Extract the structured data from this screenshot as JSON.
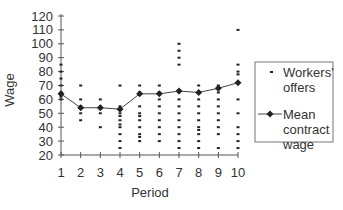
{
  "chart_data": {
    "type": "scatter",
    "title": "",
    "xlabel": "Period",
    "ylabel": "Wage",
    "xlim": [
      1,
      10
    ],
    "ylim": [
      20,
      120
    ],
    "x_ticks": [
      1,
      2,
      3,
      4,
      5,
      6,
      7,
      8,
      9,
      10
    ],
    "y_ticks": [
      20,
      30,
      40,
      50,
      60,
      70,
      80,
      90,
      100,
      110,
      120
    ],
    "grid": false,
    "legend_position": "right",
    "series": [
      {
        "name": "Workers' offers",
        "kind": "scatter",
        "marker": "dash",
        "points": [
          {
            "x": 1,
            "values": [
              85,
              80,
              75,
              70,
              65,
              62,
              60
            ]
          },
          {
            "x": 2,
            "values": [
              70,
              60,
              55,
              50,
              45
            ]
          },
          {
            "x": 3,
            "values": [
              60,
              55,
              50,
              40
            ]
          },
          {
            "x": 4,
            "values": [
              70,
              55,
              50,
              48,
              45,
              42,
              40,
              35,
              30,
              25
            ]
          },
          {
            "x": 5,
            "values": [
              70,
              65,
              55,
              50,
              48,
              45,
              40,
              35,
              33,
              30
            ]
          },
          {
            "x": 6,
            "values": [
              70,
              65,
              60,
              55,
              50,
              45,
              40,
              35,
              30
            ]
          },
          {
            "x": 7,
            "values": [
              100,
              95,
              90,
              85,
              65,
              60,
              55,
              50,
              45,
              40,
              35,
              30,
              25
            ]
          },
          {
            "x": 8,
            "values": [
              70,
              65,
              60,
              55,
              50,
              45,
              40,
              38,
              35,
              30,
              25
            ]
          },
          {
            "x": 9,
            "values": [
              70,
              65,
              60,
              55,
              50,
              45,
              40,
              35,
              25
            ]
          },
          {
            "x": 10,
            "values": [
              110,
              85,
              80,
              78,
              72,
              60,
              50,
              40,
              35,
              30,
              25
            ]
          }
        ]
      },
      {
        "name": "Mean contract wage",
        "kind": "line",
        "marker": "diamond",
        "x": [
          1,
          2,
          3,
          4,
          5,
          6,
          7,
          8,
          9,
          10
        ],
        "values": [
          64,
          54,
          54,
          53,
          64,
          64,
          66,
          65,
          68,
          72
        ]
      }
    ]
  },
  "legend": {
    "items": [
      {
        "lines": [
          "Workers'",
          "offers"
        ]
      },
      {
        "lines": [
          "Mean",
          "contract",
          "wage"
        ]
      }
    ]
  },
  "colors": {
    "axis": "#555555",
    "marker": "#222222",
    "line": "#444444",
    "legend_border": "#777777"
  }
}
